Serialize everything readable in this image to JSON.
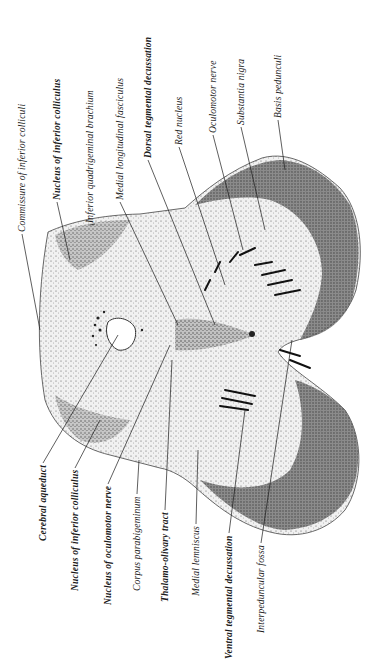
{
  "figure": {
    "colors": {
      "ink": "#1a1a1a",
      "paper": "#ffffff",
      "tissue_light": "#e6e6e6",
      "tissue_dark": "#6e6e6e"
    }
  },
  "labels_top": [
    {
      "text": "Commissure of inferior colliculi",
      "x": 22,
      "y": 232,
      "bold": false,
      "tip": [
        40,
        330
      ]
    },
    {
      "text": "Nucleus of inferior colliculus",
      "x": 57,
      "y": 200,
      "bold": true,
      "tip": [
        70,
        260
      ]
    },
    {
      "text": "Inferior quadrigeminal brachium",
      "x": 90,
      "y": 223,
      "bold": false,
      "tip": [
        95,
        224
      ]
    },
    {
      "text": "Medial longitudinal fasciculus",
      "x": 120,
      "y": 200,
      "bold": false,
      "tip": [
        178,
        325
      ]
    },
    {
      "text": "Dorsal tegmental decussation",
      "x": 148,
      "y": 158,
      "bold": true,
      "tip": [
        215,
        325
      ]
    },
    {
      "text": "Red nucleus",
      "x": 179,
      "y": 145,
      "bold": false,
      "tip": [
        225,
        285
      ]
    },
    {
      "text": "Oculomotor nerve",
      "x": 213,
      "y": 133,
      "bold": false,
      "tip": [
        243,
        250
      ]
    },
    {
      "text": "Substantia nigra",
      "x": 241,
      "y": 125,
      "bold": false,
      "tip": [
        265,
        230
      ]
    },
    {
      "text": "Basis pedunculi",
      "x": 278,
      "y": 118,
      "bold": false,
      "tip": [
        285,
        170
      ]
    }
  ],
  "labels_bottom": [
    {
      "text": "Cerebral aqueduct",
      "x": 43,
      "y": 465,
      "bold": true,
      "tip": [
        118,
        335
      ]
    },
    {
      "text": "Nucleus of inferior colliculus",
      "x": 75,
      "y": 470,
      "bold": true,
      "tip": [
        100,
        420
      ]
    },
    {
      "text": "Nucleus of oculomotor nerve",
      "x": 108,
      "y": 486,
      "bold": true,
      "tip": [
        170,
        345
      ]
    },
    {
      "text": "Corpus parabigeminum",
      "x": 137,
      "y": 496,
      "bold": false,
      "tip": [
        139,
        460
      ]
    },
    {
      "text": "Thalamo-olivary tract",
      "x": 165,
      "y": 512,
      "bold": true,
      "tip": [
        172,
        360
      ]
    },
    {
      "text": "Medial lemniscus",
      "x": 196,
      "y": 526,
      "bold": false,
      "tip": [
        198,
        450
      ]
    },
    {
      "text": "Ventral tegmental decussation",
      "x": 229,
      "y": 535,
      "bold": true,
      "tip": [
        245,
        410
      ]
    },
    {
      "text": "Interpeduncular fossa",
      "x": 261,
      "y": 545,
      "bold": false,
      "tip": [
        292,
        340
      ]
    }
  ]
}
